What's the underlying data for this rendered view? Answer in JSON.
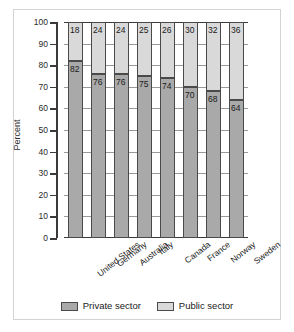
{
  "chart_data": {
    "type": "bar",
    "subtype": "stacked-bar-100-percent",
    "title": "",
    "xlabel": "",
    "ylabel": "Percent",
    "ylim": [
      0,
      100
    ],
    "ytick_step": 10,
    "yticks": [
      100,
      90,
      80,
      70,
      60,
      50,
      40,
      30,
      20,
      10,
      0
    ],
    "grid": true,
    "grid_axis": "y",
    "legend_position": "bottom-center",
    "categories": [
      "United States",
      "Germany",
      "Australia",
      "Italy",
      "Canada",
      "France",
      "Norway",
      "Sweden"
    ],
    "series": [
      {
        "name": "Private sector",
        "color": "#a9a9a9",
        "values": [
          82,
          76,
          76,
          75,
          74,
          70,
          68,
          64
        ]
      },
      {
        "name": "Public sector",
        "color": "#d9d9d9",
        "values": [
          18,
          24,
          24,
          25,
          26,
          30,
          32,
          36
        ]
      }
    ],
    "value_labels": {
      "private": [
        "82",
        "76",
        "76",
        "75",
        "74",
        "70",
        "68",
        "64"
      ],
      "public": [
        "18",
        "24",
        "24",
        "25",
        "26",
        "30",
        "32",
        "36"
      ]
    }
  },
  "axis": {
    "ylabel": "Percent",
    "ytick_labels": [
      "100",
      "90",
      "80",
      "70",
      "60",
      "50",
      "40",
      "30",
      "20",
      "10",
      "0"
    ]
  },
  "legend": {
    "items": [
      {
        "label": "Private sector",
        "color": "#a9a9a9"
      },
      {
        "label": "Public sector",
        "color": "#d9d9d9"
      }
    ]
  },
  "colors": {
    "private_sector": "#a9a9a9",
    "public_sector": "#d9d9d9",
    "axis": "#3a3a3a",
    "grid": "#9a9a9a",
    "frame": "#d3d3d3",
    "background": "#ffffff"
  }
}
